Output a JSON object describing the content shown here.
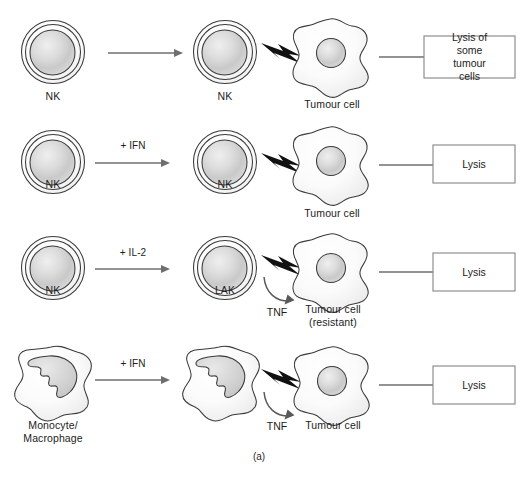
{
  "figure": {
    "caption": "(a)",
    "colors": {
      "cell_outline": "#3a3a3a",
      "arrow": "#6e6e6e",
      "bolt": "#111111",
      "box_border": "#8a8a8a",
      "text": "#1c1c1c",
      "background": "#ffffff"
    }
  },
  "rows": [
    {
      "id": "row-nk-baseline",
      "effector_label": "NK",
      "effector_icon": "nk-cell-icon",
      "arrow_label": "",
      "activated_label": "NK",
      "activated_icon": "nk-cell-icon",
      "bolt_icon": "lightning-bolt-icon",
      "cytokine_label": "",
      "target_label": "Tumour cell",
      "target_icon": "tumour-cell-icon",
      "outcome_label": "Lysis of some\ntumour cells"
    },
    {
      "id": "row-nk-ifn",
      "effector_label": "NK",
      "effector_icon": "nk-cell-icon",
      "arrow_label": "+ IFN",
      "activated_label": "NK",
      "activated_icon": "nk-cell-icon",
      "bolt_icon": "lightning-bolt-icon",
      "cytokine_label": "",
      "target_label": "Tumour cell",
      "target_icon": "tumour-cell-icon",
      "outcome_label": "Lysis"
    },
    {
      "id": "row-lak-il2",
      "effector_label": "NK",
      "effector_icon": "nk-cell-icon",
      "arrow_label": "+ IL-2",
      "activated_label": "LAK",
      "activated_icon": "lak-cell-icon",
      "bolt_icon": "lightning-bolt-icon",
      "cytokine_label": "TNF",
      "target_label": "Tumour cell\n(resistant)",
      "target_icon": "tumour-cell-icon",
      "outcome_label": "Lysis"
    },
    {
      "id": "row-macrophage-ifn",
      "effector_label": "Monocyte/\nMacrophage",
      "effector_icon": "macrophage-cell-icon",
      "arrow_label": "+ IFN",
      "activated_label": "",
      "activated_icon": "macrophage-cell-icon",
      "bolt_icon": "lightning-bolt-icon",
      "cytokine_label": "TNF",
      "target_label": "Tumour cell",
      "target_icon": "tumour-cell-icon",
      "outcome_label": "Lysis"
    }
  ]
}
